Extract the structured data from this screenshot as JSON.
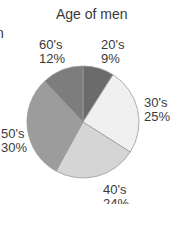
{
  "chart_data": {
    "type": "pie",
    "title": "Age of men",
    "start_angle": "12 o'clock",
    "direction": "clockwise",
    "categories": [
      "20's",
      "30's",
      "40's",
      "50's",
      "60's"
    ],
    "values": [
      9,
      25,
      24,
      30,
      12
    ],
    "value_labels": [
      "9%",
      "25%",
      "24%",
      "30%",
      "12%"
    ],
    "colors": [
      "#6b6b6b",
      "#f0f0f0",
      "#d5d5d5",
      "#9c9c9c",
      "#7d7d7d"
    ],
    "legend": "none (direct labels)"
  },
  "title": "Age of men",
  "cropped_text": "n",
  "labels": {
    "s20": {
      "name": "20's",
      "pct": "9%"
    },
    "s30": {
      "name": "30's",
      "pct": "25%"
    },
    "s40": {
      "name": "40's",
      "pct": "24%"
    },
    "s50": {
      "name": "50's",
      "pct": "30%"
    },
    "s60": {
      "name": "60's",
      "pct": "12%"
    }
  }
}
